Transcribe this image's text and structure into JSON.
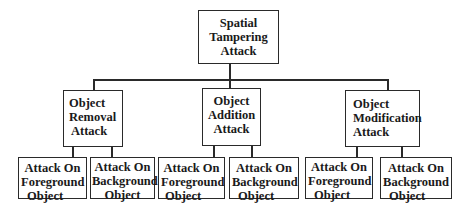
{
  "diagram": {
    "type": "tree",
    "root": {
      "label_lines": [
        "Spatial",
        "Tampering",
        "Attack"
      ]
    },
    "children": [
      {
        "label_lines": [
          "Object",
          "Removal",
          "Attack"
        ],
        "children": [
          {
            "label_lines": [
              "Attack On",
              "Foreground",
              "Object"
            ]
          },
          {
            "label_lines": [
              "Attack On",
              "Background",
              "Object"
            ]
          }
        ]
      },
      {
        "label_lines": [
          "Object",
          "Addition",
          "Attack"
        ],
        "children": [
          {
            "label_lines": [
              "Attack On",
              "Foreground",
              "Object"
            ]
          },
          {
            "label_lines": [
              "Attack On",
              "Background",
              "Object"
            ]
          }
        ]
      },
      {
        "label_lines": [
          "Object",
          "Modification",
          "Attack"
        ],
        "children": [
          {
            "label_lines": [
              "Attack On",
              "Foreground",
              "Object"
            ]
          },
          {
            "label_lines": [
              "Attack On",
              "Background",
              "Object"
            ]
          }
        ]
      }
    ]
  }
}
